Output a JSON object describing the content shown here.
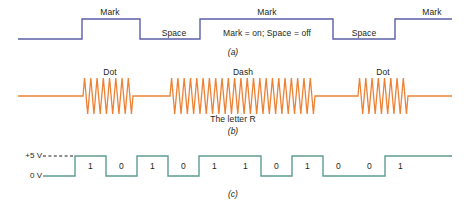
{
  "figure": {
    "width": 466,
    "height": 206,
    "background": "#ffffff"
  },
  "colors": {
    "mark_space_wave": "#5b5fa8",
    "morse_wave": "#ed8136",
    "digital_wave": "#5f9c93",
    "text": "#231f20"
  },
  "panel_a": {
    "caption": "(a)",
    "note": "Mark = on; Space = off",
    "labels": [
      {
        "text": "Mark",
        "x": 110,
        "y": 8
      },
      {
        "text": "Space",
        "x": 174,
        "y": 29
      },
      {
        "text": "Mark",
        "x": 267,
        "y": 8
      },
      {
        "text": "Space",
        "x": 364,
        "y": 29
      },
      {
        "text": "Mark",
        "x": 432,
        "y": 8
      }
    ],
    "signal": {
      "description": "Mark/Space binary on-off keying waveform",
      "high_y": 19,
      "low_y": 39,
      "segments": [
        {
          "level": "space",
          "x0": 18,
          "x1": 82
        },
        {
          "level": "mark",
          "x0": 82,
          "x1": 140
        },
        {
          "level": "space",
          "x0": 140,
          "x1": 200
        },
        {
          "level": "mark",
          "x0": 200,
          "x1": 333
        },
        {
          "level": "space",
          "x0": 333,
          "x1": 395
        },
        {
          "level": "mark",
          "x0": 395,
          "x1": 452
        }
      ]
    }
  },
  "panel_b": {
    "caption": "(b)",
    "note": "The letter R",
    "labels": [
      {
        "text": "Dot",
        "x": 110,
        "y": 8
      },
      {
        "text": "Dash",
        "x": 243,
        "y": 8
      },
      {
        "text": "Dot",
        "x": 383,
        "y": 8
      }
    ],
    "signal": {
      "description": "Morse code CW tone bursts spelling the letter R (dot dash dot)",
      "baseline_y": 36,
      "amplitude": 18,
      "bursts": [
        {
          "element": "dot",
          "x0": 83,
          "x1": 133,
          "cycles": 8
        },
        {
          "element": "dash",
          "x0": 170,
          "x1": 315,
          "cycles": 23
        },
        {
          "element": "dot",
          "x0": 358,
          "x1": 408,
          "cycles": 8
        }
      ],
      "line_start": 18,
      "line_end": 452
    }
  },
  "panel_c": {
    "caption": "(c)",
    "axis": {
      "high_label": "+5 V",
      "low_label": "0 V"
    },
    "bits": [
      "1",
      "0",
      "1",
      "0",
      "1",
      "1",
      "0",
      "1",
      "0",
      "0",
      "1"
    ],
    "signal": {
      "description": "TTL level digital pulse train, 0 V to +5 V",
      "high_y": 18,
      "low_y": 38,
      "start_x": 43,
      "end_x": 452,
      "first_edge_x": 75,
      "bit_width": 31,
      "dash_line": {
        "x0": 43,
        "x1": 75,
        "y": 18
      }
    }
  }
}
